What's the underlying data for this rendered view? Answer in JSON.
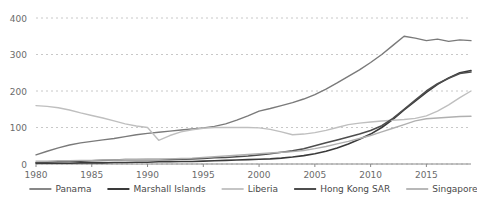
{
  "chart_data": {
    "type": "line",
    "title": "",
    "xlabel": "",
    "ylabel": "",
    "xlim": [
      1980,
      2019
    ],
    "ylim": [
      0,
      400
    ],
    "grid": true,
    "grid_axis": "y",
    "grid_style": "dotted",
    "legend_position": "bottom",
    "yticks": [
      0,
      100,
      200,
      300,
      400
    ],
    "xticks": [
      1980,
      1985,
      1990,
      1995,
      2000,
      2005,
      2010,
      2015
    ],
    "x": [
      1980,
      1981,
      1982,
      1983,
      1984,
      1985,
      1986,
      1987,
      1988,
      1989,
      1990,
      1991,
      1992,
      1993,
      1994,
      1995,
      1996,
      1997,
      1998,
      1999,
      2000,
      2001,
      2002,
      2003,
      2004,
      2005,
      2006,
      2007,
      2008,
      2009,
      2010,
      2011,
      2012,
      2013,
      2014,
      2015,
      2016,
      2017,
      2018,
      2019
    ],
    "series": [
      {
        "name": "Panama",
        "color": "#7a7a7a",
        "width": 1.4,
        "values": [
          25,
          35,
          44,
          52,
          58,
          62,
          66,
          70,
          75,
          80,
          84,
          87,
          90,
          93,
          96,
          99,
          103,
          110,
          120,
          132,
          145,
          152,
          160,
          168,
          178,
          190,
          205,
          222,
          240,
          258,
          278,
          300,
          325,
          350,
          345,
          338,
          342,
          336,
          340,
          338
        ]
      },
      {
        "name": "Marshall Islands",
        "color": "#3a3a3a",
        "width": 1.6,
        "values": [
          2,
          2,
          2,
          2,
          3,
          3,
          3,
          4,
          4,
          5,
          5,
          6,
          6,
          7,
          7,
          8,
          9,
          10,
          11,
          12,
          13,
          14,
          16,
          19,
          23,
          28,
          35,
          44,
          55,
          68,
          82,
          100,
          122,
          148,
          172,
          196,
          218,
          236,
          250,
          256
        ]
      },
      {
        "name": "Liberia",
        "color": "#bfbfbf",
        "width": 1.4,
        "values": [
          160,
          158,
          154,
          148,
          140,
          133,
          126,
          118,
          110,
          104,
          100,
          65,
          78,
          88,
          94,
          98,
          100,
          100,
          100,
          100,
          99,
          95,
          88,
          80,
          82,
          86,
          92,
          100,
          108,
          112,
          115,
          118,
          120,
          122,
          125,
          132,
          145,
          162,
          182,
          200
        ]
      },
      {
        "name": "Hong Kong SAR",
        "color": "#4d4d4d",
        "width": 1.6,
        "values": [
          4,
          5,
          6,
          7,
          8,
          9,
          10,
          11,
          12,
          12,
          12,
          12,
          12,
          13,
          14,
          15,
          17,
          18,
          20,
          22,
          25,
          28,
          32,
          36,
          42,
          50,
          58,
          66,
          74,
          82,
          92,
          105,
          125,
          150,
          175,
          200,
          220,
          235,
          248,
          252
        ]
      },
      {
        "name": "Singapore",
        "color": "#b0b0b0",
        "width": 1.4,
        "values": [
          8,
          8,
          9,
          9,
          10,
          10,
          11,
          11,
          12,
          12,
          13,
          13,
          14,
          15,
          16,
          18,
          20,
          22,
          24,
          26,
          28,
          30,
          32,
          34,
          37,
          42,
          48,
          55,
          62,
          70,
          78,
          88,
          98,
          108,
          118,
          124,
          126,
          128,
          130,
          131
        ]
      }
    ]
  },
  "axis": {
    "ytick_labels": [
      "0",
      "100",
      "200",
      "300",
      "400"
    ],
    "xtick_labels": [
      "1980",
      "1985",
      "1990",
      "1995",
      "2000",
      "2005",
      "2010",
      "2015"
    ]
  },
  "legend": {
    "items": [
      {
        "label": "Panama"
      },
      {
        "label": "Marshall Islands"
      },
      {
        "label": "Liberia"
      },
      {
        "label": "Hong Kong SAR"
      },
      {
        "label": "Singapore"
      }
    ]
  }
}
